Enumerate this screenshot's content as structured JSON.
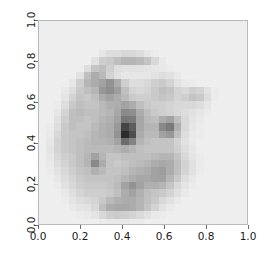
{
  "figure": {
    "background_color": "#ffffff",
    "axes_background_color": "#f2f2f0",
    "frame_color": "#b9b9b9",
    "tick_color": "#6e6e6e",
    "label_color": "#1a1a1a"
  },
  "axis": {
    "x": {
      "label": "",
      "tick_labels": [
        "0.0",
        "0.2",
        "0.4",
        "0.6",
        "0.8",
        "1.0"
      ],
      "tick_values": [
        0.0,
        0.2,
        0.4,
        0.6,
        0.8,
        1.0
      ],
      "range": [
        0.0,
        1.0
      ]
    },
    "y": {
      "label": "",
      "tick_labels": [
        "0.0",
        "0.2",
        "0.4",
        "0.6",
        "0.8",
        "1.0"
      ],
      "tick_values": [
        0.0,
        0.2,
        0.4,
        0.6,
        0.8,
        1.0
      ],
      "range": [
        0.0,
        1.0
      ],
      "tick_label_rotation": -90
    }
  },
  "chart_data": {
    "type": "heatmap",
    "title": "",
    "xlabel": "",
    "ylabel": "",
    "xlim": [
      0.0,
      1.0
    ],
    "ylim": [
      0.0,
      1.0
    ],
    "grid": false,
    "legend": "none",
    "colormap": "gray_r",
    "vmin": 0.0,
    "vmax": 1.0,
    "n_rows": 28,
    "n_cols": 28,
    "extent": [
      0.0,
      1.0,
      0.0,
      1.0
    ],
    "x_tick_labels": [
      "0.0",
      "0.2",
      "0.4",
      "0.6",
      "0.8",
      "1.0"
    ],
    "y_tick_labels": [
      "0.0",
      "0.2",
      "0.4",
      "0.6",
      "0.8",
      "1.0"
    ],
    "values": [
      [
        0.03,
        0.03,
        0.03,
        0.03,
        0.03,
        0.03,
        0.03,
        0.03,
        0.03,
        0.03,
        0.03,
        0.03,
        0.03,
        0.03,
        0.03,
        0.03,
        0.03,
        0.03,
        0.03,
        0.03,
        0.03,
        0.03,
        0.03,
        0.03,
        0.03,
        0.03,
        0.03,
        0.03
      ],
      [
        0.03,
        0.03,
        0.03,
        0.03,
        0.03,
        0.03,
        0.03,
        0.03,
        0.03,
        0.03,
        0.03,
        0.03,
        0.03,
        0.03,
        0.03,
        0.03,
        0.03,
        0.03,
        0.03,
        0.03,
        0.03,
        0.03,
        0.03,
        0.03,
        0.03,
        0.03,
        0.03,
        0.03
      ],
      [
        0.03,
        0.03,
        0.03,
        0.03,
        0.03,
        0.03,
        0.03,
        0.03,
        0.03,
        0.03,
        0.03,
        0.03,
        0.03,
        0.03,
        0.03,
        0.03,
        0.03,
        0.03,
        0.03,
        0.03,
        0.03,
        0.03,
        0.03,
        0.03,
        0.03,
        0.03,
        0.03,
        0.03
      ],
      [
        0.03,
        0.03,
        0.03,
        0.03,
        0.03,
        0.03,
        0.03,
        0.03,
        0.03,
        0.03,
        0.03,
        0.03,
        0.03,
        0.03,
        0.03,
        0.03,
        0.03,
        0.03,
        0.03,
        0.03,
        0.03,
        0.03,
        0.03,
        0.03,
        0.03,
        0.03,
        0.03,
        0.03
      ],
      [
        0.03,
        0.03,
        0.03,
        0.03,
        0.03,
        0.03,
        0.03,
        0.03,
        0.06,
        0.1,
        0.1,
        0.12,
        0.12,
        0.1,
        0.06,
        0.04,
        0.03,
        0.03,
        0.03,
        0.03,
        0.03,
        0.03,
        0.03,
        0.03,
        0.03,
        0.03,
        0.03,
        0.03
      ],
      [
        0.03,
        0.03,
        0.03,
        0.03,
        0.03,
        0.03,
        0.03,
        0.08,
        0.16,
        0.18,
        0.22,
        0.26,
        0.26,
        0.24,
        0.2,
        0.12,
        0.05,
        0.03,
        0.03,
        0.03,
        0.03,
        0.03,
        0.03,
        0.03,
        0.03,
        0.03,
        0.03,
        0.03
      ],
      [
        0.03,
        0.03,
        0.03,
        0.03,
        0.03,
        0.03,
        0.1,
        0.2,
        0.22,
        0.16,
        0.1,
        0.08,
        0.08,
        0.08,
        0.07,
        0.06,
        0.05,
        0.04,
        0.03,
        0.03,
        0.03,
        0.03,
        0.03,
        0.03,
        0.03,
        0.03,
        0.03,
        0.03
      ],
      [
        0.03,
        0.03,
        0.03,
        0.03,
        0.03,
        0.08,
        0.22,
        0.3,
        0.24,
        0.14,
        0.08,
        0.06,
        0.06,
        0.06,
        0.06,
        0.08,
        0.1,
        0.08,
        0.05,
        0.03,
        0.03,
        0.03,
        0.03,
        0.03,
        0.03,
        0.03,
        0.03,
        0.03
      ],
      [
        0.03,
        0.03,
        0.03,
        0.03,
        0.06,
        0.16,
        0.26,
        0.3,
        0.34,
        0.4,
        0.3,
        0.16,
        0.1,
        0.1,
        0.12,
        0.16,
        0.18,
        0.14,
        0.08,
        0.05,
        0.04,
        0.03,
        0.03,
        0.03,
        0.03,
        0.03,
        0.03,
        0.03
      ],
      [
        0.03,
        0.03,
        0.03,
        0.05,
        0.1,
        0.18,
        0.22,
        0.26,
        0.38,
        0.42,
        0.36,
        0.22,
        0.14,
        0.12,
        0.14,
        0.18,
        0.22,
        0.2,
        0.14,
        0.12,
        0.16,
        0.14,
        0.08,
        0.04,
        0.03,
        0.03,
        0.03,
        0.03
      ],
      [
        0.03,
        0.03,
        0.03,
        0.07,
        0.14,
        0.2,
        0.18,
        0.22,
        0.3,
        0.34,
        0.3,
        0.24,
        0.18,
        0.16,
        0.16,
        0.18,
        0.2,
        0.18,
        0.14,
        0.16,
        0.2,
        0.18,
        0.1,
        0.04,
        0.03,
        0.03,
        0.03,
        0.03
      ],
      [
        0.03,
        0.03,
        0.04,
        0.1,
        0.18,
        0.22,
        0.2,
        0.2,
        0.24,
        0.28,
        0.3,
        0.34,
        0.3,
        0.22,
        0.18,
        0.16,
        0.16,
        0.14,
        0.12,
        0.12,
        0.12,
        0.1,
        0.06,
        0.03,
        0.03,
        0.03,
        0.03,
        0.03
      ],
      [
        0.03,
        0.03,
        0.06,
        0.14,
        0.22,
        0.24,
        0.22,
        0.22,
        0.24,
        0.26,
        0.32,
        0.44,
        0.42,
        0.3,
        0.22,
        0.18,
        0.16,
        0.14,
        0.12,
        0.1,
        0.08,
        0.06,
        0.04,
        0.03,
        0.03,
        0.03,
        0.03,
        0.03
      ],
      [
        0.03,
        0.03,
        0.08,
        0.16,
        0.22,
        0.22,
        0.2,
        0.22,
        0.26,
        0.28,
        0.34,
        0.52,
        0.5,
        0.32,
        0.24,
        0.22,
        0.3,
        0.34,
        0.22,
        0.12,
        0.07,
        0.05,
        0.03,
        0.03,
        0.03,
        0.03,
        0.03,
        0.03
      ],
      [
        0.03,
        0.04,
        0.1,
        0.18,
        0.22,
        0.2,
        0.2,
        0.24,
        0.28,
        0.3,
        0.38,
        0.72,
        0.62,
        0.32,
        0.26,
        0.26,
        0.44,
        0.5,
        0.28,
        0.12,
        0.06,
        0.04,
        0.03,
        0.03,
        0.03,
        0.03,
        0.03,
        0.03
      ],
      [
        0.03,
        0.05,
        0.12,
        0.18,
        0.2,
        0.2,
        0.22,
        0.26,
        0.28,
        0.3,
        0.4,
        0.82,
        0.68,
        0.3,
        0.24,
        0.24,
        0.34,
        0.38,
        0.22,
        0.1,
        0.05,
        0.04,
        0.03,
        0.03,
        0.03,
        0.03,
        0.03,
        0.03
      ],
      [
        0.03,
        0.06,
        0.14,
        0.18,
        0.2,
        0.22,
        0.24,
        0.26,
        0.26,
        0.28,
        0.34,
        0.56,
        0.46,
        0.26,
        0.22,
        0.2,
        0.2,
        0.2,
        0.14,
        0.08,
        0.05,
        0.03,
        0.03,
        0.03,
        0.03,
        0.03,
        0.03,
        0.03
      ],
      [
        0.03,
        0.07,
        0.14,
        0.18,
        0.2,
        0.22,
        0.24,
        0.24,
        0.24,
        0.24,
        0.26,
        0.3,
        0.26,
        0.22,
        0.2,
        0.2,
        0.2,
        0.2,
        0.16,
        0.1,
        0.06,
        0.03,
        0.03,
        0.03,
        0.03,
        0.03,
        0.03,
        0.03
      ],
      [
        0.03,
        0.06,
        0.12,
        0.16,
        0.18,
        0.22,
        0.26,
        0.34,
        0.26,
        0.2,
        0.2,
        0.22,
        0.22,
        0.22,
        0.22,
        0.24,
        0.26,
        0.26,
        0.2,
        0.12,
        0.07,
        0.04,
        0.03,
        0.03,
        0.03,
        0.03,
        0.03,
        0.03
      ],
      [
        0.03,
        0.05,
        0.1,
        0.14,
        0.18,
        0.22,
        0.26,
        0.44,
        0.3,
        0.2,
        0.18,
        0.2,
        0.22,
        0.24,
        0.26,
        0.3,
        0.32,
        0.3,
        0.22,
        0.14,
        0.08,
        0.04,
        0.03,
        0.03,
        0.03,
        0.03,
        0.03,
        0.03
      ],
      [
        0.03,
        0.04,
        0.08,
        0.12,
        0.16,
        0.2,
        0.22,
        0.28,
        0.24,
        0.2,
        0.2,
        0.22,
        0.26,
        0.28,
        0.3,
        0.34,
        0.36,
        0.3,
        0.22,
        0.14,
        0.08,
        0.04,
        0.03,
        0.03,
        0.03,
        0.03,
        0.03,
        0.03
      ],
      [
        0.03,
        0.03,
        0.06,
        0.1,
        0.14,
        0.18,
        0.2,
        0.2,
        0.2,
        0.2,
        0.22,
        0.26,
        0.3,
        0.32,
        0.32,
        0.34,
        0.34,
        0.26,
        0.18,
        0.1,
        0.06,
        0.03,
        0.03,
        0.03,
        0.03,
        0.03,
        0.03,
        0.03
      ],
      [
        0.03,
        0.03,
        0.04,
        0.08,
        0.12,
        0.16,
        0.18,
        0.18,
        0.18,
        0.2,
        0.24,
        0.34,
        0.4,
        0.34,
        0.28,
        0.28,
        0.26,
        0.2,
        0.12,
        0.07,
        0.04,
        0.03,
        0.03,
        0.03,
        0.03,
        0.03,
        0.03,
        0.03
      ],
      [
        0.03,
        0.03,
        0.03,
        0.05,
        0.09,
        0.13,
        0.16,
        0.16,
        0.16,
        0.18,
        0.22,
        0.3,
        0.34,
        0.28,
        0.22,
        0.2,
        0.18,
        0.14,
        0.09,
        0.05,
        0.03,
        0.03,
        0.03,
        0.03,
        0.03,
        0.03,
        0.03,
        0.03
      ],
      [
        0.03,
        0.03,
        0.03,
        0.04,
        0.07,
        0.1,
        0.12,
        0.14,
        0.18,
        0.24,
        0.28,
        0.3,
        0.3,
        0.26,
        0.22,
        0.18,
        0.12,
        0.08,
        0.05,
        0.03,
        0.03,
        0.03,
        0.03,
        0.03,
        0.03,
        0.03,
        0.03,
        0.03
      ],
      [
        0.03,
        0.03,
        0.03,
        0.03,
        0.05,
        0.07,
        0.08,
        0.12,
        0.22,
        0.3,
        0.32,
        0.32,
        0.3,
        0.26,
        0.2,
        0.14,
        0.08,
        0.05,
        0.03,
        0.03,
        0.03,
        0.03,
        0.03,
        0.03,
        0.03,
        0.03,
        0.03,
        0.03
      ],
      [
        0.03,
        0.03,
        0.03,
        0.03,
        0.03,
        0.04,
        0.05,
        0.07,
        0.12,
        0.16,
        0.17,
        0.16,
        0.14,
        0.11,
        0.08,
        0.05,
        0.04,
        0.03,
        0.03,
        0.03,
        0.03,
        0.03,
        0.03,
        0.03,
        0.03,
        0.03,
        0.03,
        0.03
      ],
      [
        0.03,
        0.03,
        0.03,
        0.03,
        0.03,
        0.03,
        0.03,
        0.03,
        0.04,
        0.05,
        0.05,
        0.05,
        0.04,
        0.04,
        0.03,
        0.03,
        0.03,
        0.03,
        0.03,
        0.03,
        0.03,
        0.03,
        0.03,
        0.03,
        0.03,
        0.03,
        0.03,
        0.03
      ]
    ]
  }
}
